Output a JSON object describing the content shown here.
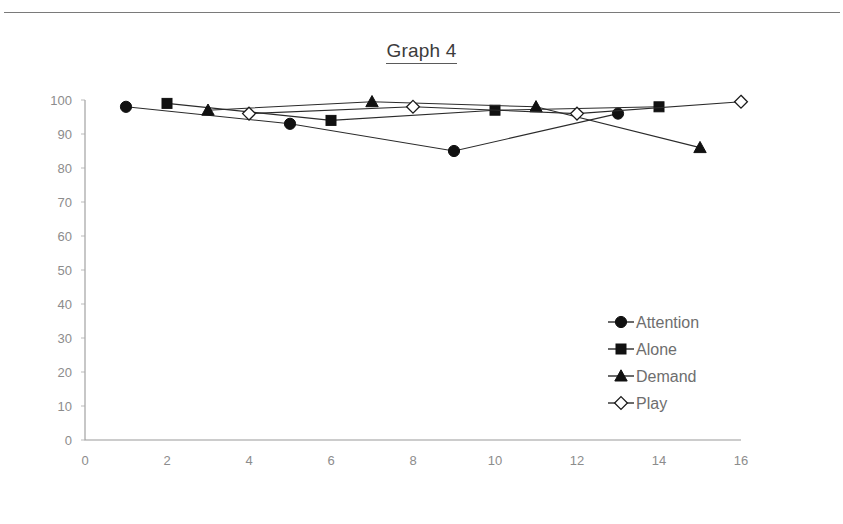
{
  "document": {
    "title": "Graph 4",
    "has_top_rule": true
  },
  "chart_data": {
    "type": "line",
    "title": "Graph 4",
    "xlabel": "",
    "ylabel": "",
    "xlim": [
      0,
      16
    ],
    "ylim": [
      0,
      100
    ],
    "x_ticks": [
      0,
      2,
      4,
      6,
      8,
      10,
      12,
      14,
      16
    ],
    "y_ticks": [
      0,
      10,
      20,
      30,
      40,
      50,
      60,
      70,
      80,
      90,
      100
    ],
    "grid": false,
    "legend_position": "center-right",
    "series": [
      {
        "name": "Attention",
        "marker": "filled-circle",
        "color": "#111111",
        "x": [
          1,
          5,
          9,
          13
        ],
        "y": [
          98,
          93,
          85,
          96
        ]
      },
      {
        "name": "Alone",
        "marker": "filled-square",
        "color": "#111111",
        "x": [
          2,
          6,
          10,
          14
        ],
        "y": [
          99,
          94,
          97,
          98
        ]
      },
      {
        "name": "Demand",
        "marker": "filled-triangle",
        "color": "#111111",
        "x": [
          3,
          7,
          11,
          15
        ],
        "y": [
          97,
          99.5,
          98,
          86
        ]
      },
      {
        "name": "Play",
        "marker": "open-diamond",
        "color": "#111111",
        "x": [
          4,
          8,
          12,
          16
        ],
        "y": [
          96,
          98,
          96,
          99.5
        ]
      }
    ]
  },
  "legend": {
    "entries": [
      {
        "label": "Attention",
        "marker": "filled-circle"
      },
      {
        "label": "Alone",
        "marker": "filled-square"
      },
      {
        "label": "Demand",
        "marker": "filled-triangle"
      },
      {
        "label": "Play",
        "marker": "open-diamond"
      }
    ]
  },
  "axis": {
    "y_tick_labels": [
      "100",
      "90",
      "80",
      "70",
      "60",
      "50",
      "40",
      "30",
      "20",
      "10",
      "0"
    ],
    "x_tick_labels": [
      "0",
      "2",
      "4",
      "6",
      "8",
      "10",
      "12",
      "14",
      "16"
    ]
  }
}
